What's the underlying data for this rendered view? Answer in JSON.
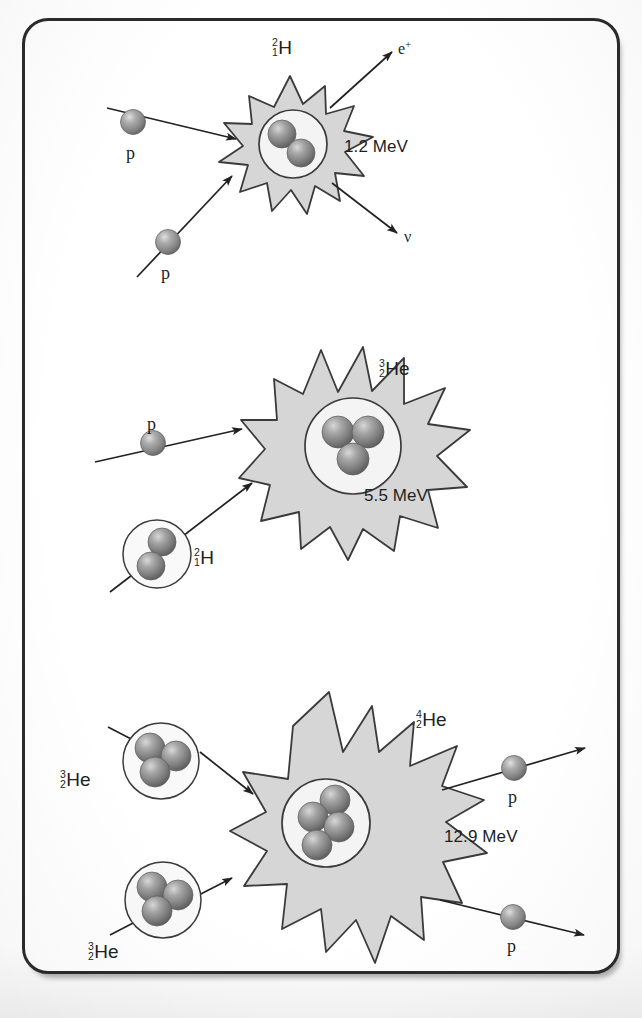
{
  "figure": {
    "frame_border_color": "#2b2b2b",
    "background_color": "#ffffff"
  },
  "style": {
    "burst_fill": "#d6d6d6",
    "burst_stroke": "#3a3a3a",
    "nucleus_circle_fill": "#f4f4f4",
    "nucleus_circle_stroke": "#3a3a3a",
    "nucleon_color": "#7c7c7c",
    "nucleon_highlight": "#c9c9c9",
    "arrow_color": "#222222",
    "text_color": "#211f1f"
  },
  "reactions": [
    {
      "id": "step-1",
      "energy": "1.2 MeV",
      "product_isotope": {
        "mass_number": "2",
        "atomic_number": "1",
        "symbol": "H"
      },
      "inputs": [
        {
          "id": "proton-1",
          "label": "p",
          "kind": "proton"
        },
        {
          "id": "proton-2",
          "label": "p",
          "kind": "proton"
        }
      ],
      "outputs": [
        {
          "id": "positron",
          "label": "e",
          "superscript": "+",
          "kind": "positron"
        },
        {
          "id": "neutrino",
          "label": "ν",
          "kind": "neutrino"
        }
      ],
      "product_nucleons": 2
    },
    {
      "id": "step-2",
      "energy": "5.5 MeV",
      "product_isotope": {
        "mass_number": "3",
        "atomic_number": "2",
        "symbol": "He"
      },
      "inputs": [
        {
          "id": "proton-3",
          "label": "p",
          "kind": "proton"
        },
        {
          "id": "deuterium",
          "label": "",
          "kind": "nucleus",
          "isotope": {
            "mass_number": "2",
            "atomic_number": "1",
            "symbol": "H"
          },
          "nucleons": 2
        }
      ],
      "outputs": [],
      "product_nucleons": 3
    },
    {
      "id": "step-3",
      "energy": "12.9 MeV",
      "product_isotope": {
        "mass_number": "4",
        "atomic_number": "2",
        "symbol": "He"
      },
      "inputs": [
        {
          "id": "helium3-a",
          "label": "",
          "kind": "nucleus",
          "isotope": {
            "mass_number": "3",
            "atomic_number": "2",
            "symbol": "He"
          },
          "nucleons": 3
        },
        {
          "id": "helium3-b",
          "label": "",
          "kind": "nucleus",
          "isotope": {
            "mass_number": "3",
            "atomic_number": "2",
            "symbol": "He"
          },
          "nucleons": 3
        }
      ],
      "outputs": [
        {
          "id": "proton-out-1",
          "label": "p",
          "kind": "proton"
        },
        {
          "id": "proton-out-2",
          "label": "p",
          "kind": "proton"
        }
      ],
      "product_nucleons": 4
    }
  ]
}
